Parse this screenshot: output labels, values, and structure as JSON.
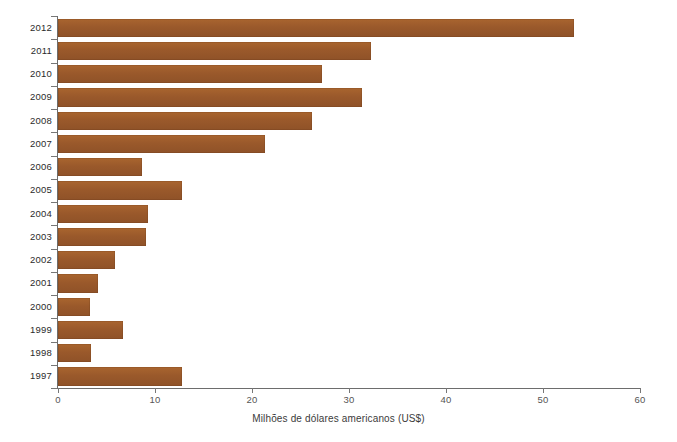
{
  "chart_data": {
    "type": "bar",
    "orientation": "horizontal",
    "title": "",
    "subtitle": "",
    "xlabel": "Milhões de dólares americanos (US$)",
    "ylabel": "",
    "xlim": [
      0,
      60
    ],
    "xticks": [
      0,
      10,
      20,
      30,
      40,
      50,
      60
    ],
    "xticklabels": [
      "0",
      "10",
      "20",
      "30",
      "40",
      "50",
      "60"
    ],
    "grid": false,
    "legend": null,
    "bar_color": "#9c5a2c",
    "axis_color": "#6d6d6d",
    "categories": [
      "2012",
      "2011",
      "2010",
      "2009",
      "2008",
      "2007",
      "2006",
      "2005",
      "2004",
      "2003",
      "2002",
      "2001",
      "2000",
      "1999",
      "1998",
      "1997"
    ],
    "values": [
      53.2,
      32.3,
      27.2,
      31.3,
      26.2,
      21.3,
      8.7,
      12.8,
      9.3,
      9.1,
      5.9,
      4.1,
      3.3,
      6.7,
      3.4,
      12.8
    ],
    "series": [
      {
        "name": "Milhões de dólares americanos (US$)",
        "values": [
          53.2,
          32.3,
          27.2,
          31.3,
          26.2,
          21.3,
          8.7,
          12.8,
          9.3,
          9.1,
          5.9,
          4.1,
          3.3,
          6.7,
          3.4,
          12.8
        ]
      }
    ]
  }
}
